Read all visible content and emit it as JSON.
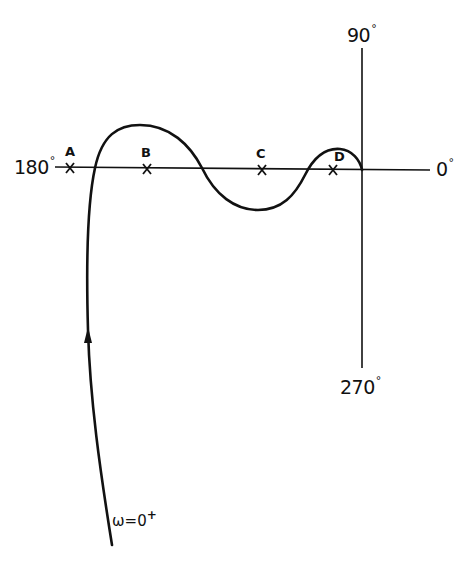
{
  "diagram": {
    "type": "nyquist-polar-plot",
    "axes": {
      "left_label": "180",
      "right_label": "0",
      "top_label": "90",
      "bottom_label": "270",
      "degree_symbol": "°"
    },
    "points": [
      {
        "id": "A",
        "label": "A"
      },
      {
        "id": "B",
        "label": "B"
      },
      {
        "id": "C",
        "label": "C"
      },
      {
        "id": "D",
        "label": "D"
      }
    ],
    "curve": {
      "start_label_main": "ω=0",
      "start_label_sup": "+",
      "direction": "arrow pointing up along the curve from ω=0⁺"
    },
    "colors": {
      "ink": "#111111",
      "background": "#ffffff"
    }
  }
}
